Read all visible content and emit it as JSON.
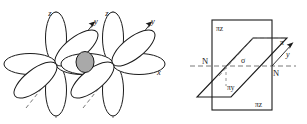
{
  "figure": {
    "caption": "",
    "background_color": "#ffffff",
    "stroke_color": "#1a1a1a",
    "dash_color": "#555555",
    "lobe_fill": "#ffffff",
    "overlap_fill": "#a9a9a9",
    "width": 307,
    "height": 124
  },
  "left_panel": {
    "name": "orbital-overlap-diagram",
    "description": "Two atomic centers each bearing six p-orbital lobes, joined by a shaded sigma overlap region, drawn on x, y, z axes.",
    "centers": [
      {
        "id": "left-center",
        "cx": 56,
        "cy": 64,
        "lobe_count": 6
      },
      {
        "id": "right-center",
        "cx": 113,
        "cy": 64,
        "lobe_count": 6
      }
    ],
    "overlap": {
      "cx": 85,
      "cy": 62,
      "rx": 9,
      "ry": 10,
      "color": "#a9a9a9"
    },
    "axes": [
      {
        "id": "z-axis-left",
        "label": "z",
        "x": 54,
        "y": 12
      },
      {
        "id": "y-axis-left",
        "label": "y",
        "x": 96,
        "y": 22
      },
      {
        "id": "z-axis-right",
        "label": "z",
        "x": 111,
        "y": 12
      },
      {
        "id": "y-axis-right",
        "label": "y",
        "x": 152,
        "y": 22
      },
      {
        "id": "x-axis",
        "label": "x",
        "x": 160,
        "y": 74
      }
    ]
  },
  "right_panel": {
    "name": "nodal-plane-diagram",
    "description": "Two mutually perpendicular nodal planes: a vertical rectangle labelled pi z and a slanted parallelogram labelled pi y, crossing along the sigma internuclear axis between two nuclei marked N.",
    "planes": [
      {
        "id": "pi-z-plane",
        "shape": "rectangle",
        "label_top": "πz",
        "label_bottom": "πz",
        "label_top_pos": {
          "x": 217,
          "y": 29
        },
        "label_bottom_pos": {
          "x": 258,
          "y": 105
        }
      },
      {
        "id": "pi-y-plane",
        "shape": "parallelogram",
        "label": "πy",
        "label_pos": {
          "x": 224,
          "y": 90
        }
      }
    ],
    "axis_labels": [
      {
        "id": "sigma-label",
        "text": "σ",
        "x": 243,
        "y": 61,
        "italic": false
      },
      {
        "id": "pi-label",
        "text": "π",
        "x": 283,
        "y": 44,
        "italic": false
      },
      {
        "id": "y-label",
        "text": "y",
        "x": 288,
        "y": 55,
        "italic": true
      }
    ],
    "nuclei": [
      {
        "id": "nucleus-left",
        "text": "N",
        "x": 205,
        "y": 64
      },
      {
        "id": "nucleus-right",
        "text": "N",
        "x": 271,
        "y": 73
      }
    ]
  }
}
